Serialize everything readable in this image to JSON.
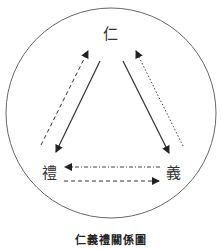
{
  "diagram": {
    "title": "仁義禮關係圖",
    "nodes": [
      {
        "id": "ren",
        "label": "仁",
        "position": "top"
      },
      {
        "id": "li",
        "label": "禮",
        "position": "bottom-left"
      },
      {
        "id": "yi",
        "label": "義",
        "position": "bottom-right"
      }
    ],
    "edges": [
      {
        "from": "ren",
        "to": "li",
        "style": "solid"
      },
      {
        "from": "ren",
        "to": "yi",
        "style": "solid"
      },
      {
        "from": "li",
        "to": "ren",
        "style": "dashed"
      },
      {
        "from": "yi",
        "to": "ren",
        "style": "dotted"
      },
      {
        "from": "yi",
        "to": "li",
        "style": "dash-dot"
      },
      {
        "from": "li",
        "to": "yi",
        "style": "dashed"
      }
    ],
    "enclosure": "circle"
  },
  "colors": {
    "stroke": "#333333",
    "circle": "#666666",
    "background": "#ffffff"
  }
}
